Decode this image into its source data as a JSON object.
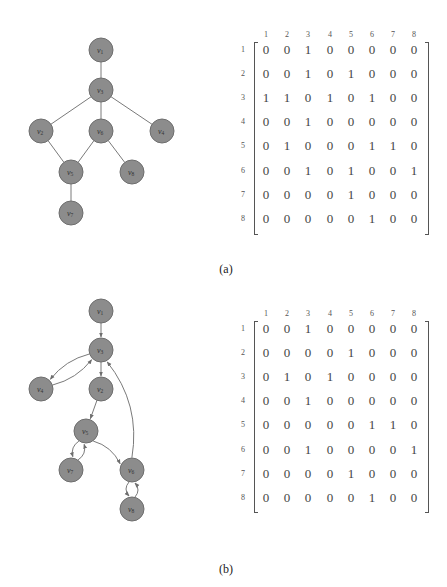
{
  "panels": [
    {
      "id": "a",
      "caption": "(a)",
      "graph": {
        "directed": false,
        "nodes": [
          {
            "id": "v1",
            "label": "v",
            "sub": "1",
            "x": 101,
            "y": 50
          },
          {
            "id": "v3",
            "label": "v",
            "sub": "3",
            "x": 101,
            "y": 90
          },
          {
            "id": "v2",
            "label": "v",
            "sub": "2",
            "x": 41,
            "y": 131
          },
          {
            "id": "v6",
            "label": "v",
            "sub": "6",
            "x": 101,
            "y": 131
          },
          {
            "id": "v4",
            "label": "v",
            "sub": "4",
            "x": 162,
            "y": 131
          },
          {
            "id": "v5",
            "label": "v",
            "sub": "5",
            "x": 71,
            "y": 172
          },
          {
            "id": "v8",
            "label": "v",
            "sub": "8",
            "x": 132,
            "y": 172
          },
          {
            "id": "v7",
            "label": "v",
            "sub": "7",
            "x": 71,
            "y": 213
          }
        ],
        "edges": [
          [
            "v1",
            "v3"
          ],
          [
            "v3",
            "v2"
          ],
          [
            "v3",
            "v6"
          ],
          [
            "v3",
            "v4"
          ],
          [
            "v2",
            "v5"
          ],
          [
            "v6",
            "v5"
          ],
          [
            "v6",
            "v8"
          ],
          [
            "v5",
            "v7"
          ]
        ]
      },
      "matrix": {
        "col_headers": [
          "1",
          "2",
          "3",
          "4",
          "5",
          "6",
          "7",
          "8"
        ],
        "row_headers": [
          "1",
          "2",
          "3",
          "4",
          "5",
          "6",
          "7",
          "8"
        ],
        "rows": [
          [
            "0",
            "0",
            "1",
            "0",
            "0",
            "0",
            "0",
            "0"
          ],
          [
            "0",
            "0",
            "1",
            "0",
            "1",
            "0",
            "0",
            "0"
          ],
          [
            "1",
            "1",
            "0",
            "1",
            "0",
            "1",
            "0",
            "0"
          ],
          [
            "0",
            "0",
            "1",
            "0",
            "0",
            "0",
            "0",
            "0"
          ],
          [
            "0",
            "1",
            "0",
            "0",
            "0",
            "1",
            "1",
            "0"
          ],
          [
            "0",
            "0",
            "1",
            "0",
            "1",
            "0",
            "0",
            "1"
          ],
          [
            "0",
            "0",
            "0",
            "0",
            "1",
            "0",
            "0",
            "0"
          ],
          [
            "0",
            "0",
            "0",
            "0",
            "0",
            "1",
            "0",
            "0"
          ]
        ]
      }
    },
    {
      "id": "b",
      "caption": "(b)",
      "graph": {
        "directed": true,
        "nodes": [
          {
            "id": "v1",
            "label": "v",
            "sub": "1",
            "x": 101,
            "y": 31
          },
          {
            "id": "v3",
            "label": "v",
            "sub": "3",
            "x": 101,
            "y": 70
          },
          {
            "id": "v4",
            "label": "v",
            "sub": "4",
            "x": 41,
            "y": 109
          },
          {
            "id": "v2",
            "label": "v",
            "sub": "2",
            "x": 101,
            "y": 109
          },
          {
            "id": "v5",
            "label": "v",
            "sub": "5",
            "x": 86,
            "y": 151
          },
          {
            "id": "v7",
            "label": "v",
            "sub": "7",
            "x": 71,
            "y": 190
          },
          {
            "id": "v6",
            "label": "v",
            "sub": "6",
            "x": 132,
            "y": 190
          },
          {
            "id": "v8",
            "label": "v",
            "sub": "8",
            "x": 132,
            "y": 229
          }
        ],
        "edges": [
          [
            "v1",
            "v3"
          ],
          [
            "v3",
            "v2"
          ],
          [
            "v3",
            "v4"
          ],
          [
            "v4",
            "v3"
          ],
          [
            "v2",
            "v5"
          ],
          [
            "v5",
            "v6"
          ],
          [
            "v5",
            "v7"
          ],
          [
            "v7",
            "v5"
          ],
          [
            "v6",
            "v3"
          ],
          [
            "v6",
            "v8"
          ],
          [
            "v8",
            "v6"
          ]
        ]
      },
      "matrix": {
        "col_headers": [
          "1",
          "2",
          "3",
          "4",
          "5",
          "6",
          "7",
          "8"
        ],
        "row_headers": [
          "1",
          "2",
          "3",
          "4",
          "5",
          "6",
          "7",
          "8"
        ],
        "rows": [
          [
            "0",
            "0",
            "1",
            "0",
            "0",
            "0",
            "0",
            "0"
          ],
          [
            "0",
            "0",
            "0",
            "0",
            "1",
            "0",
            "0",
            "0"
          ],
          [
            "0",
            "1",
            "0",
            "1",
            "0",
            "0",
            "0",
            "0"
          ],
          [
            "0",
            "0",
            "1",
            "0",
            "0",
            "0",
            "0",
            "0"
          ],
          [
            "0",
            "0",
            "0",
            "0",
            "0",
            "1",
            "1",
            "0"
          ],
          [
            "0",
            "0",
            "1",
            "0",
            "0",
            "0",
            "0",
            "1"
          ],
          [
            "0",
            "0",
            "0",
            "0",
            "1",
            "0",
            "0",
            "0"
          ],
          [
            "0",
            "0",
            "0",
            "0",
            "0",
            "1",
            "0",
            "0"
          ]
        ]
      }
    }
  ],
  "colors": {
    "node_fill": "#8c8c8c",
    "node_stroke": "#6e6e6e",
    "edge": "#7a7a7a"
  }
}
